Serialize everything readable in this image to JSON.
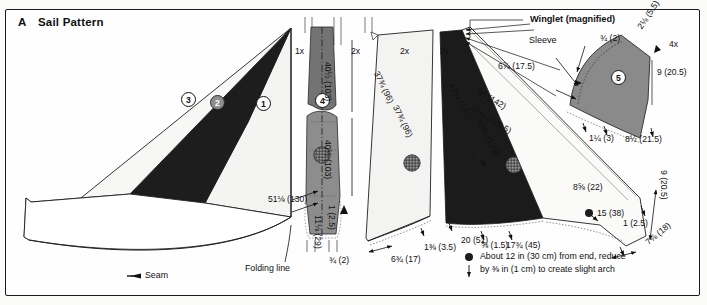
{
  "figure": {
    "panel_letter": "A",
    "title": "Sail Pattern"
  },
  "legend": {
    "seam_label": "Seam",
    "folding_line_label": "Folding line",
    "arch_note_line1": "About 12 in (30 cm) from end, reduce",
    "arch_note_line2": "by ⅜ in (1 cm) to create slight arch"
  },
  "callouts": {
    "winglet": "Winglet (magnified)",
    "sleeve": "Sleeve"
  },
  "quantities": {
    "main_sail": "1x",
    "mast_sleeve": "2x",
    "panel_center": "1x",
    "panel_light": "2x",
    "panel_dark": "2x",
    "winglet": "4x"
  },
  "part_numbers": [
    {
      "id": "1",
      "style": "white"
    },
    {
      "id": "2",
      "style": "gray"
    },
    {
      "id": "3",
      "style": "white"
    },
    {
      "id": "4",
      "style": "white"
    },
    {
      "id": "5",
      "style": "white"
    }
  ],
  "dimensions": {
    "center_panel_upper": "40½ (103)",
    "center_panel_lower": "40½ (103)",
    "center_panel_length": "51⅛ (130)",
    "center_panel_width": "11⅛ (29)",
    "center_panel_base": "¾ (2)",
    "center_panel_taper": "1 (2.5)",
    "light_leading_edge": "37¾ (96)",
    "light_trailing_edge": "37¾ (96)",
    "light_base": "6¾ (17)",
    "light_offset": "1⅜ (3.5)",
    "light_foot": "20 (51)",
    "dark_leading_edge": "47¼ (121)",
    "dark_trailing_edge": "48½ (123)",
    "outer_long": "56 (142)",
    "outer_long_alt": "47½ (120.5)",
    "sleeve_width": "6⅞ (17.5)",
    "winglet_tip": "2⅛ (5.5)",
    "winglet_sleeve": "¾ (2)",
    "winglet_height": "9 (20.5)",
    "winglet_base": "8½ (21.5)",
    "winglet_offset": "1¼ (3)",
    "dark_foot_a": "8⅝ (22)",
    "dark_foot_b": "15 (38)",
    "dark_foot_c": "⅝ (1.5)",
    "dark_foot_d": "17¾ (45)",
    "right_edge": "9 (20.5)",
    "right_foot_a": "1 (2.5)",
    "right_foot_b": "7⅛ (18)"
  }
}
